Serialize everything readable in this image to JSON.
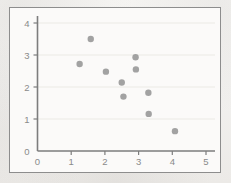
{
  "chart_data": {
    "type": "scatter",
    "title": "",
    "xlabel": "",
    "ylabel": "",
    "xlim": [
      0,
      5
    ],
    "ylim": [
      0,
      4
    ],
    "xticks": [
      0,
      1,
      2,
      3,
      4,
      5
    ],
    "yticks": [
      0,
      1,
      2,
      3,
      4
    ],
    "xtick_labels": [
      "0",
      "1",
      "2",
      "3",
      "4",
      "5"
    ],
    "ytick_labels": [
      "0",
      "1",
      "2",
      "3",
      "4"
    ],
    "grid": "horizontal",
    "legend": "none",
    "marker": {
      "shape": "circle",
      "color": "#9a9a9a",
      "size": 5.2
    },
    "series": [
      {
        "name": "series-1",
        "points": [
          {
            "x": 1.25,
            "y": 2.72
          },
          {
            "x": 1.58,
            "y": 3.5
          },
          {
            "x": 2.03,
            "y": 2.48
          },
          {
            "x": 2.5,
            "y": 2.14
          },
          {
            "x": 2.55,
            "y": 1.7
          },
          {
            "x": 2.91,
            "y": 2.93
          },
          {
            "x": 2.92,
            "y": 2.55
          },
          {
            "x": 3.29,
            "y": 1.82
          },
          {
            "x": 3.3,
            "y": 1.16
          },
          {
            "x": 4.08,
            "y": 0.62
          }
        ]
      }
    ]
  },
  "style": {
    "axis_color": "#7d7d7d",
    "grid_color": "#ebe9e6",
    "frame_color": "#8d8d8d",
    "plot_background": "#fbfaf9",
    "page_background": "#f4f3f1",
    "tick_label_color": "#8a8a8a"
  }
}
